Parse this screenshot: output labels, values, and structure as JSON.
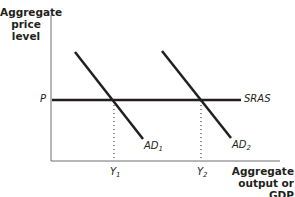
{
  "diagram": {
    "type": "AD-AS shift",
    "y_axis_label": [
      "Aggregate",
      "price",
      "level"
    ],
    "x_axis_label": [
      "Aggregate",
      "output or GDP"
    ],
    "curves": {
      "sras": {
        "label": "SRAS"
      },
      "ad1": {
        "label": "AD",
        "sub": "1"
      },
      "ad2": {
        "label": "AD",
        "sub": "2"
      }
    },
    "ticks": {
      "p": "P",
      "y1": {
        "label": "Y",
        "sub": "1"
      },
      "y2": {
        "label": "Y",
        "sub": "2"
      }
    },
    "colors": {
      "line": "#231f20",
      "background": "#ffffff"
    }
  }
}
